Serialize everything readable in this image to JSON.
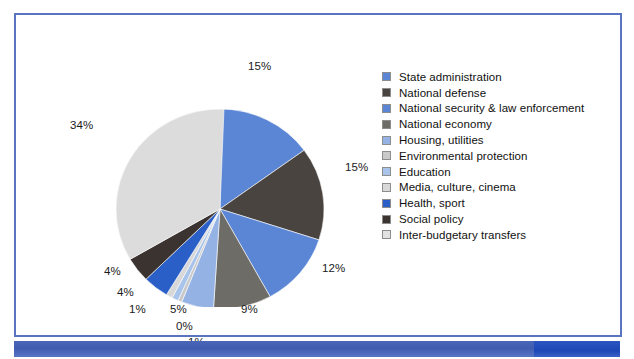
{
  "frame": {
    "border_color": "#5b74c0",
    "background": "#ffffff"
  },
  "bottom_bar": {
    "main_color": "#41 5EB2",
    "accent_color": "#1d47b5"
  },
  "chart_data": {
    "type": "pie",
    "title": "",
    "legend_position": "right",
    "categories": [
      "State administration",
      "National defense",
      "National security & law enforcement",
      "National economy",
      "Housing, utilities",
      "Environmental protection",
      "Education",
      "Media, culture, cinema",
      "Health, sport",
      "Social policy",
      "Inter-budgetary transfers"
    ],
    "values": [
      15,
      15,
      12,
      9,
      5,
      0,
      1,
      1,
      4,
      4,
      34
    ],
    "labels": [
      "15%",
      "15%",
      "12%",
      "9%",
      "5%",
      "0%",
      "1%",
      "1%",
      "4%",
      "4%",
      "34%"
    ],
    "colors": [
      "#5b86d6",
      "#4a4440",
      "#5b86d6",
      "#6e6c67",
      "#94b3e4",
      "#c9c9c9",
      "#a9c4ea",
      "#d8d8d8",
      "#2a5fc8",
      "#3a3330",
      "#dcdcdc"
    ]
  },
  "legend": {
    "items": [
      {
        "label": "State administration",
        "color": "#5b86d6"
      },
      {
        "label": "National defense",
        "color": "#4a4440"
      },
      {
        "label": "National security & law enforcement",
        "color": "#5b86d6"
      },
      {
        "label": "National economy",
        "color": "#6e6c67"
      },
      {
        "label": "Housing, utilities",
        "color": "#94b3e4"
      },
      {
        "label": "Environmental protection",
        "color": "#c9c9c9"
      },
      {
        "label": "Education",
        "color": "#a9c4ea"
      },
      {
        "label": "Media, culture, cinema",
        "color": "#d8d8d8"
      },
      {
        "label": "Health, sport",
        "color": "#2a5fc8"
      },
      {
        "label": "Social policy",
        "color": "#3a3330"
      },
      {
        "label": "Inter-budgetary transfers",
        "color": "#e2e2e2"
      }
    ]
  },
  "slice_labels": [
    {
      "text": "15%",
      "x": 232,
      "y": 45
    },
    {
      "text": "15%",
      "x": 329,
      "y": 146
    },
    {
      "text": "12%",
      "x": 306,
      "y": 247
    },
    {
      "text": "9%",
      "x": 225,
      "y": 288
    },
    {
      "text": "5%",
      "x": 154,
      "y": 288
    },
    {
      "text": "0%",
      "x": 160,
      "y": 305
    },
    {
      "text": "1%",
      "x": 172,
      "y": 321
    },
    {
      "text": "1%",
      "x": 113,
      "y": 288
    },
    {
      "text": "4%",
      "x": 101,
      "y": 271
    },
    {
      "text": "4%",
      "x": 88,
      "y": 250
    },
    {
      "text": "34%",
      "x": 54,
      "y": 104
    }
  ]
}
